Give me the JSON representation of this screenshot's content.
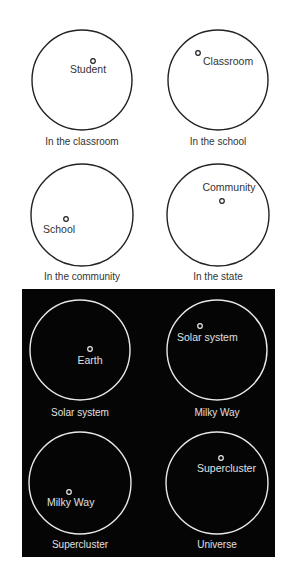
{
  "figure": {
    "light_section": {
      "background": "#ffffff",
      "stroke": "#222222",
      "text_color": "#333333",
      "panels": [
        {
          "id": "classroom",
          "circle": {
            "cx": 82,
            "cy": 80,
            "r": 50
          },
          "dot": {
            "x": 93,
            "y": 61
          },
          "label": "Student",
          "label_pos": {
            "x": 88,
            "y": 73,
            "anchor": "middle"
          },
          "caption": "In the classroom",
          "caption_pos": {
            "x": 82,
            "y": 145
          }
        },
        {
          "id": "school",
          "circle": {
            "cx": 218,
            "cy": 80,
            "r": 50
          },
          "dot": {
            "x": 198,
            "y": 53
          },
          "label": "Classroom",
          "label_pos": {
            "x": 203,
            "y": 65,
            "anchor": "start"
          },
          "caption": "In the school",
          "caption_pos": {
            "x": 218,
            "y": 145
          }
        },
        {
          "id": "community",
          "circle": {
            "cx": 82,
            "cy": 215,
            "r": 51
          },
          "dot": {
            "x": 66,
            "y": 219
          },
          "label": "School",
          "label_pos": {
            "x": 43,
            "y": 233,
            "anchor": "start"
          },
          "caption": "In the community",
          "caption_pos": {
            "x": 82,
            "y": 280
          }
        },
        {
          "id": "state",
          "circle": {
            "cx": 218,
            "cy": 215,
            "r": 51
          },
          "dot": {
            "x": 222,
            "y": 201
          },
          "label": "Community",
          "label_pos": {
            "x": 229,
            "y": 191,
            "anchor": "middle"
          },
          "caption": "In the state",
          "caption_pos": {
            "x": 218,
            "y": 280
          }
        }
      ]
    },
    "dark_section": {
      "background": "#050505",
      "stroke": "#e8e8e8",
      "text_color": "#e0e0e0",
      "panels": [
        {
          "id": "solar-system",
          "circle": {
            "cx": 80,
            "cy": 350,
            "r": 50
          },
          "dot": {
            "x": 90,
            "y": 349
          },
          "label": "Earth",
          "label_pos": {
            "x": 90,
            "y": 364,
            "anchor": "middle"
          },
          "caption": "Solar system",
          "caption_pos": {
            "x": 80,
            "y": 416
          }
        },
        {
          "id": "milky-way",
          "circle": {
            "cx": 217,
            "cy": 350,
            "r": 50
          },
          "dot": {
            "x": 200,
            "y": 326
          },
          "label": "Solar system",
          "label_pos": {
            "x": 177,
            "y": 341,
            "anchor": "start"
          },
          "caption": "Milky Way",
          "caption_pos": {
            "x": 217,
            "y": 416
          }
        },
        {
          "id": "supercluster",
          "circle": {
            "cx": 80,
            "cy": 483,
            "r": 51
          },
          "dot": {
            "x": 69,
            "y": 492
          },
          "label": "Milky Way",
          "label_pos": {
            "x": 47,
            "y": 506,
            "anchor": "start"
          },
          "caption": "Supercluster",
          "caption_pos": {
            "x": 80,
            "y": 548
          }
        },
        {
          "id": "universe",
          "circle": {
            "cx": 217,
            "cy": 483,
            "r": 51
          },
          "dot": {
            "x": 221,
            "y": 458
          },
          "label": "Supercluster",
          "label_pos": {
            "x": 197,
            "y": 472,
            "anchor": "start"
          },
          "caption": "Universe",
          "caption_pos": {
            "x": 217,
            "y": 548
          }
        }
      ]
    }
  }
}
